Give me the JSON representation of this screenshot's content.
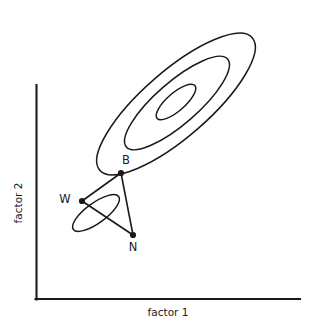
{
  "chart_data": {
    "type": "scatter",
    "title": "",
    "subtitle": "",
    "xlabel": "factor 1",
    "ylabel": "factor 2",
    "xticklabels": [],
    "yticklabels": [],
    "grid": false,
    "legend": null,
    "axis_style": "two-spine L-shaped, no ticks, no tick labels",
    "annotations": [
      {
        "label": "W",
        "x": 82,
        "y": 201,
        "desc": "labeled data point W, left vertex"
      },
      {
        "label": "B",
        "x": 121,
        "y": 173,
        "desc": "labeled data point B, upper vertex"
      },
      {
        "label": "N",
        "x": 133,
        "y": 235,
        "desc": "labeled data point N, lower vertex"
      }
    ],
    "points": [
      {
        "name": "W",
        "px": 82,
        "py": 201
      },
      {
        "name": "B",
        "px": 121,
        "py": 173
      },
      {
        "name": "N",
        "px": 133,
        "py": 235
      }
    ],
    "connectors": [
      {
        "from": "W",
        "to": "B"
      },
      {
        "from": "W",
        "to": "N"
      },
      {
        "from": "B",
        "to": "N"
      }
    ],
    "contours": [
      {
        "name": "outer-contour",
        "cx": 176,
        "cy": 104,
        "rx": 101,
        "ry": 33,
        "rotation_deg": -41
      },
      {
        "name": "middle-contour",
        "cx": 177,
        "cy": 103,
        "rx": 67,
        "ry": 21,
        "rotation_deg": -41
      },
      {
        "name": "inner-contour",
        "cx": 176,
        "cy": 102,
        "rx": 25,
        "ry": 9,
        "rotation_deg": -41
      },
      {
        "name": "small-contour-near-w",
        "cx": 96,
        "cy": 213,
        "rx": 28,
        "ry": 10,
        "rotation_deg": -36
      }
    ]
  },
  "axes": {
    "x_label": "factor 1",
    "y_label": "factor 2",
    "origin_px": {
      "x": 35,
      "y": 300
    },
    "x_end_px": 300,
    "y_top_px": 85
  },
  "labels": {
    "w": "W",
    "b": "B",
    "n": "N"
  },
  "colors": {
    "ink": "#1a1a1a",
    "background": "#ffffff"
  }
}
